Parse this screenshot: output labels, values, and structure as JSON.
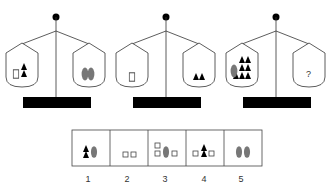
{
  "puzzle": {
    "type": "balance-scale-puzzle",
    "scales": [
      {
        "id": 1,
        "left_pan": [
          "square",
          "triangle",
          "triangle"
        ],
        "right_pan": [
          "oval",
          "oval"
        ]
      },
      {
        "id": 2,
        "left_pan": [
          "square"
        ],
        "right_pan": [
          "triangle",
          "triangle"
        ]
      },
      {
        "id": 3,
        "left_pan": [
          "oval",
          "triangle",
          "triangle",
          "triangle",
          "triangle",
          "triangle",
          "triangle",
          "triangle"
        ],
        "right_pan": [
          "?"
        ]
      }
    ],
    "question_mark": "?",
    "options": [
      {
        "label": "1",
        "items": [
          "triangle",
          "triangle",
          "oval"
        ]
      },
      {
        "label": "2",
        "items": [
          "square",
          "square"
        ]
      },
      {
        "label": "3",
        "items": [
          "square",
          "square",
          "oval",
          "square"
        ]
      },
      {
        "label": "4",
        "items": [
          "square",
          "triangle",
          "triangle",
          "square"
        ]
      },
      {
        "label": "5",
        "items": [
          "oval",
          "oval"
        ]
      }
    ]
  },
  "colors": {
    "line": "#333333",
    "shape_fill": "#000000",
    "oval_fill": "#777777",
    "square_stroke": "#444444",
    "base": "#000000"
  }
}
